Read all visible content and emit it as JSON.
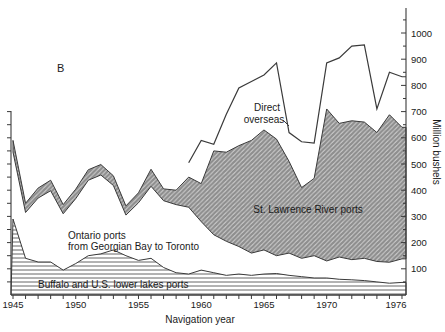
{
  "panel_label": "B",
  "axes": {
    "x_title": "Navigation year",
    "y_title": "Million bushels",
    "x_tick_labeled_years": [
      1945,
      1950,
      1955,
      1960,
      1965,
      1970,
      1976
    ],
    "y_tick_values": [
      100,
      200,
      300,
      400,
      500,
      600,
      700,
      800,
      900,
      1000
    ]
  },
  "series_labels": {
    "direct_overseas_line1": "Direct",
    "direct_overseas_line2": "overseas",
    "st_lawrence": "St. Lawrence River ports",
    "ontario_line1": "Ontario ports",
    "ontario_line2": "from Georgian Bay to Toronto",
    "buffalo": "Buffalo and U.S. lower lakes ports"
  },
  "colors": {
    "line": "#3a3a3a",
    "hatch_gray": "#8e8e8e",
    "hatch_dark": "#555555",
    "text": "#1a1a1a",
    "background": "#ffffff"
  },
  "chart_data": {
    "type": "area",
    "stacked": true,
    "title": "",
    "xlabel": "Navigation year",
    "ylabel": "Million bushels",
    "ylim": [
      0,
      1050
    ],
    "xlim": [
      1945,
      1976
    ],
    "grid": false,
    "units": "million bushels",
    "note": "values are cumulative stack-top boundaries read from the plot",
    "x": [
      1945,
      1946,
      1947,
      1948,
      1949,
      1950,
      1951,
      1952,
      1953,
      1954,
      1955,
      1956,
      1957,
      1958,
      1959,
      1960,
      1961,
      1962,
      1963,
      1964,
      1965,
      1966,
      1967,
      1968,
      1969,
      1970,
      1971,
      1972,
      1973,
      1974,
      1975,
      1976
    ],
    "series": [
      {
        "name": "Buffalo and U.S. lower lakes ports",
        "style": "horizontal-hatch",
        "cumulative": [
          290,
          140,
          126,
          126,
          95,
          120,
          150,
          157,
          172,
          150,
          132,
          140,
          105,
          85,
          80,
          95,
          85,
          75,
          80,
          75,
          80,
          82,
          75,
          70,
          65,
          65,
          60,
          58,
          55,
          50,
          45,
          48
        ]
      },
      {
        "name": "Ontario ports from Georgian Bay to Toronto",
        "style": "plain-white",
        "cumulative": [
          545,
          315,
          370,
          398,
          310,
          368,
          438,
          458,
          418,
          305,
          352,
          415,
          360,
          345,
          335,
          280,
          230,
          205,
          185,
          160,
          172,
          150,
          160,
          140,
          150,
          130,
          145,
          135,
          140,
          128,
          125,
          138
        ]
      },
      {
        "name": "St. Lawrence River ports",
        "style": "diagonal-hatch",
        "cumulative": [
          590,
          350,
          408,
          438,
          345,
          404,
          478,
          498,
          455,
          340,
          390,
          480,
          405,
          400,
          450,
          425,
          550,
          545,
          570,
          590,
          630,
          595,
          510,
          410,
          445,
          710,
          655,
          665,
          660,
          620,
          688,
          640
        ]
      },
      {
        "name": "Direct overseas",
        "style": "line",
        "cumulative": [
          null,
          null,
          null,
          null,
          null,
          null,
          null,
          null,
          null,
          null,
          null,
          null,
          null,
          null,
          505,
          590,
          575,
          690,
          790,
          815,
          840,
          886,
          620,
          585,
          580,
          886,
          905,
          950,
          955,
          710,
          850,
          833
        ]
      }
    ]
  }
}
